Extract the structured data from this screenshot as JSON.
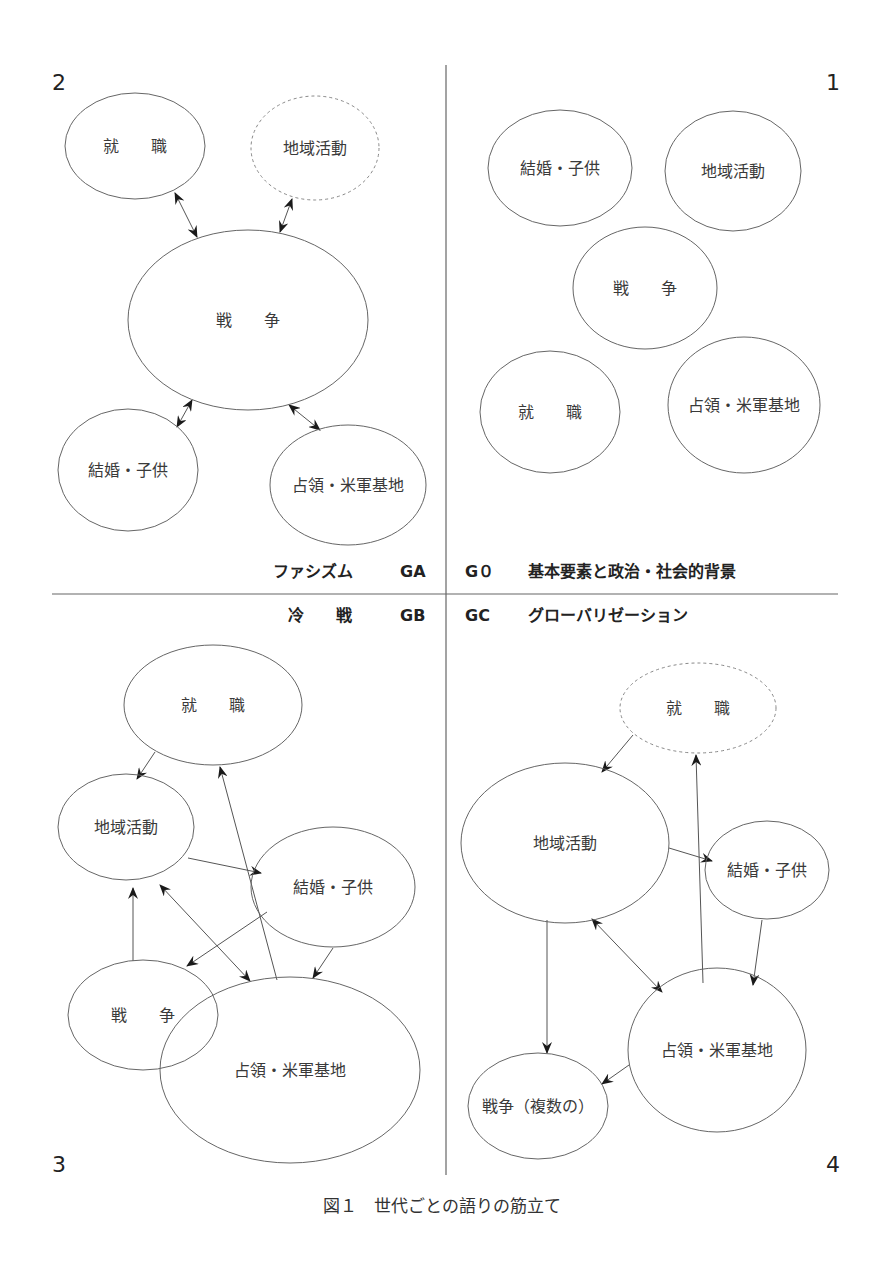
{
  "figure": {
    "caption": "図１　世代ごとの語りの筋立て",
    "dividers": {
      "vertical": {
        "x": 446,
        "y1": 65,
        "y2": 1175
      },
      "horizontal": {
        "y": 594,
        "x1": 52,
        "x2": 838
      }
    },
    "era_labels": {
      "ga": {
        "name": "ファシズム",
        "code": "GA"
      },
      "g0": {
        "code": "G０",
        "name": "基本要素と政治・社会的背景"
      },
      "gb": {
        "name": "冷　　戦",
        "code": "GB"
      },
      "gc": {
        "code": "GC",
        "name": "グローバリゼーション"
      }
    },
    "colors": {
      "line": "#666666",
      "text": "#3a3a3a",
      "background": "#ffffff"
    }
  },
  "quadrants": [
    {
      "id": "q1",
      "number": "1",
      "era": "G0",
      "nodes": [
        {
          "label": "結婚・子供",
          "cx": 560,
          "cy": 168,
          "rx": 72,
          "ry": 58,
          "dashed": false
        },
        {
          "label": "地域活動",
          "cx": 733,
          "cy": 171,
          "rx": 68,
          "ry": 60,
          "dashed": false
        },
        {
          "label": "戦　　争",
          "cx": 645,
          "cy": 288,
          "rx": 72,
          "ry": 61,
          "dashed": false
        },
        {
          "label": "就　　職",
          "cx": 550,
          "cy": 412,
          "rx": 70,
          "ry": 61,
          "dashed": false
        },
        {
          "label": "占領・米軍基地",
          "cx": 744,
          "cy": 405,
          "rx": 76,
          "ry": 68,
          "dashed": false
        }
      ],
      "edges": []
    },
    {
      "id": "q2",
      "number": "2",
      "era": "GA",
      "nodes": [
        {
          "label": "就　　職",
          "cx": 135,
          "cy": 146,
          "rx": 70,
          "ry": 53,
          "dashed": false
        },
        {
          "label": "地域活動",
          "cx": 315,
          "cy": 148,
          "rx": 64,
          "ry": 52,
          "dashed": true
        },
        {
          "label": "戦　　争",
          "cx": 248,
          "cy": 320,
          "rx": 120,
          "ry": 90,
          "dashed": false
        },
        {
          "label": "結婚・子供",
          "cx": 128,
          "cy": 470,
          "rx": 70,
          "ry": 61,
          "dashed": false
        },
        {
          "label": "占領・米軍基地",
          "cx": 348,
          "cy": 485,
          "rx": 78,
          "ry": 60,
          "dashed": false
        }
      ],
      "edges": [
        {
          "from": "就職",
          "to": "戦争",
          "x1": 175,
          "y1": 193,
          "x2": 197,
          "y2": 237,
          "bidirectional": true
        },
        {
          "from": "地域活動",
          "to": "戦争",
          "x1": 292,
          "y1": 199,
          "x2": 280,
          "y2": 232,
          "bidirectional": true
        },
        {
          "from": "戦争",
          "to": "結婚・子供",
          "x1": 192,
          "y1": 400,
          "x2": 177,
          "y2": 427,
          "bidirectional": true
        },
        {
          "from": "戦争",
          "to": "占領・米軍基地",
          "x1": 289,
          "y1": 405,
          "x2": 320,
          "y2": 430,
          "bidirectional": true
        }
      ]
    },
    {
      "id": "q3",
      "number": "3",
      "era": "GB",
      "nodes": [
        {
          "label": "就　　職",
          "cx": 213,
          "cy": 705,
          "rx": 89,
          "ry": 60,
          "dashed": false
        },
        {
          "label": "地域活動",
          "cx": 126,
          "cy": 827,
          "rx": 68,
          "ry": 53,
          "dashed": false
        },
        {
          "label": "結婚・子供",
          "cx": 333,
          "cy": 887,
          "rx": 82,
          "ry": 60,
          "dashed": false
        },
        {
          "label": "戦　　争",
          "cx": 143,
          "cy": 1015,
          "rx": 75,
          "ry": 55,
          "dashed": false
        },
        {
          "label": "占領・米軍基地",
          "cx": 290,
          "cy": 1070,
          "rx": 130,
          "ry": 93,
          "dashed": false
        }
      ],
      "edges": [
        {
          "from": "就職",
          "to": "地域活動",
          "x1": 155,
          "y1": 752,
          "x2": 137,
          "y2": 779,
          "bidirectional": false
        },
        {
          "from": "占領・米軍基地",
          "to": "就職",
          "x1": 277,
          "y1": 980,
          "x2": 220,
          "y2": 767,
          "bidirectional": false
        },
        {
          "from": "地域活動",
          "to": "結婚・子供",
          "x1": 188,
          "y1": 858,
          "x2": 261,
          "y2": 873,
          "bidirectional": false
        },
        {
          "from": "戦争",
          "to": "地域活動",
          "x1": 133,
          "y1": 961,
          "x2": 133,
          "y2": 888,
          "bidirectional": false
        },
        {
          "from": "地域活動",
          "to": "占領・米軍基地",
          "x1": 160,
          "y1": 885,
          "x2": 250,
          "y2": 981,
          "bidirectional": true
        },
        {
          "from": "結婚・子供",
          "to": "戦争",
          "x1": 267,
          "y1": 912,
          "x2": 187,
          "y2": 966,
          "bidirectional": false
        },
        {
          "from": "結婚・子供",
          "to": "占領・米軍基地",
          "x1": 333,
          "y1": 948,
          "x2": 313,
          "y2": 978,
          "bidirectional": false
        }
      ]
    },
    {
      "id": "q4",
      "number": "4",
      "era": "GC",
      "nodes": [
        {
          "label": "就　　職",
          "cx": 698,
          "cy": 708,
          "rx": 78,
          "ry": 45,
          "dashed": true
        },
        {
          "label": "地域活動",
          "cx": 565,
          "cy": 843,
          "rx": 104,
          "ry": 80,
          "dashed": false
        },
        {
          "label": "結婚・子供",
          "cx": 767,
          "cy": 870,
          "rx": 62,
          "ry": 49,
          "dashed": false
        },
        {
          "label": "占領・米軍基地",
          "cx": 717,
          "cy": 1050,
          "rx": 89,
          "ry": 82,
          "dashed": false
        },
        {
          "label": "戦争（複数の）",
          "cx": 538,
          "cy": 1106,
          "rx": 70,
          "ry": 53,
          "dashed": false
        }
      ],
      "edges": [
        {
          "from": "就職",
          "to": "地域活動",
          "x1": 633,
          "y1": 735,
          "x2": 602,
          "y2": 772,
          "bidirectional": false
        },
        {
          "from": "占領・米軍基地",
          "to": "就職",
          "x1": 703,
          "y1": 983,
          "x2": 696,
          "y2": 755,
          "bidirectional": false
        },
        {
          "from": "地域活動",
          "to": "結婚・子供",
          "x1": 669,
          "y1": 848,
          "x2": 712,
          "y2": 861,
          "bidirectional": false
        },
        {
          "from": "結婚・子供",
          "to": "占領・米軍基地",
          "x1": 762,
          "y1": 920,
          "x2": 753,
          "y2": 985,
          "bidirectional": false
        },
        {
          "from": "地域活動",
          "to": "占領・米軍基地",
          "x1": 592,
          "y1": 919,
          "x2": 662,
          "y2": 992,
          "bidirectional": true
        },
        {
          "from": "地域活動",
          "to": "戦争（複数の）",
          "x1": 547,
          "y1": 920,
          "x2": 547,
          "y2": 1053,
          "bidirectional": false
        },
        {
          "from": "占領・米軍基地",
          "to": "戦争（複数の）",
          "x1": 629,
          "y1": 1065,
          "x2": 602,
          "y2": 1084,
          "bidirectional": false
        }
      ]
    }
  ],
  "quadrant_number_positions": {
    "q1": {
      "x": 832,
      "y": 90
    },
    "q2": {
      "x": 52,
      "y": 90
    },
    "q3": {
      "x": 52,
      "y": 1172
    },
    "q4": {
      "x": 832,
      "y": 1172
    }
  }
}
